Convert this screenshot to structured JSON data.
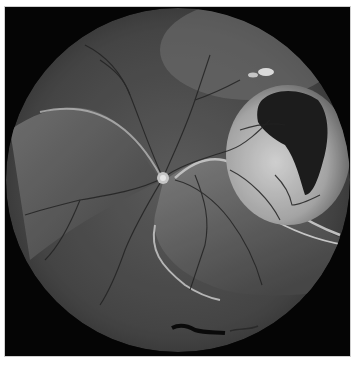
{
  "image": {
    "description": "Grayscale illustration of an ocular fundus showing a bullous retinal detachment with folds, optic disc, retinal vessels, and a dark pigmented region in the upper right",
    "background_color": "#050505",
    "border_color": "#cfcfcf",
    "fundus_base_color": "#4a4a4a",
    "highlight_color": "#d8d8d8",
    "dark_region_color": "#0e0e0e",
    "signature": "illegible signature"
  },
  "features": [
    {
      "name": "optic-disc",
      "x": 163,
      "y": 175
    },
    {
      "name": "retinal-detachment-bulla-upper-right",
      "x": 290,
      "y": 155
    },
    {
      "name": "dark-pigmented-area",
      "x": 300,
      "y": 130
    },
    {
      "name": "retinal-fold-left",
      "x": 110,
      "y": 160
    },
    {
      "name": "retinal-fold-lower-center",
      "x": 215,
      "y": 240
    },
    {
      "name": "retinal-tear",
      "x": 262,
      "y": 72
    },
    {
      "name": "signature-mark",
      "x": 200,
      "y": 330
    }
  ]
}
